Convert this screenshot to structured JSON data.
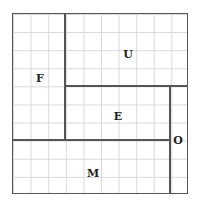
{
  "diagram": {
    "type": "rectangle-partition-grid",
    "grid": {
      "cols": 10,
      "rows": 10
    },
    "regions": [
      {
        "label": "F",
        "x": 0,
        "y": 0,
        "w": 3,
        "h": 7
      },
      {
        "label": "U",
        "x": 3,
        "y": 0,
        "w": 7,
        "h": 4
      },
      {
        "label": "E",
        "x": 3,
        "y": 4,
        "w": 6,
        "h": 3
      },
      {
        "label": "O",
        "x": 9,
        "y": 4,
        "w": 1,
        "h": 6
      },
      {
        "label": "M",
        "x": 0,
        "y": 7,
        "w": 9,
        "h": 3
      }
    ],
    "labels": {
      "F": "F",
      "U": "U",
      "E": "E",
      "O": "O",
      "M": "M"
    }
  }
}
